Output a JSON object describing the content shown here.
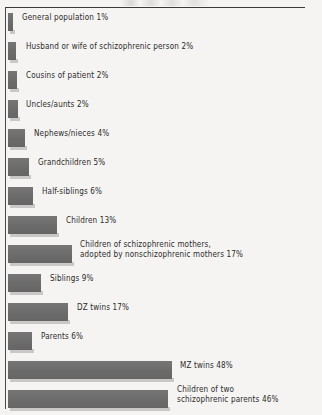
{
  "figure": {
    "background_color": "#f5f4f2",
    "bar_color": "#6e6e6e",
    "bar_shadow_color": "#c9c8c6",
    "rule_color": "#3a3a3a",
    "text_color": "#2b2b2b"
  },
  "chart_data": {
    "type": "bar",
    "orientation": "horizontal",
    "title": "",
    "subtitle": "",
    "xlabel": "",
    "ylabel": "",
    "xlim": [
      0,
      50
    ],
    "grid": false,
    "legend": null,
    "value_unit": "%",
    "categories": [
      "General population",
      "Husband or wife of schizophrenic person",
      "Cousins of patient",
      "Uncles/aunts",
      "Nephews/nieces",
      "Grandchildren",
      "Half-siblings",
      "Children",
      "Children of schizophrenic mothers, adopted by nonschizophrenic mothers",
      "Siblings",
      "DZ twins",
      "Parents",
      "MZ twins",
      "Children of two schizophrenic parents"
    ],
    "values": [
      1,
      2,
      2,
      2,
      4,
      5,
      6,
      13,
      17,
      9,
      17,
      6,
      48,
      46
    ],
    "bars": [
      {
        "label_line1": "General population 1%",
        "label_line2": "",
        "value": 1,
        "value_text": "1%",
        "bar_px": 5,
        "top_px": 4,
        "label_left_px": 22,
        "label_top_px": 3
      },
      {
        "label_line1": "Husband or wife of schizophrenic person 2%",
        "label_line2": "",
        "value": 2,
        "value_text": "2%",
        "bar_px": 8,
        "top_px": 33,
        "label_left_px": 26,
        "label_top_px": 32
      },
      {
        "label_line1": "Cousins of patient 2%",
        "label_line2": "",
        "value": 2,
        "value_text": "2%",
        "bar_px": 9,
        "top_px": 62,
        "label_left_px": 26,
        "label_top_px": 61
      },
      {
        "label_line1": "Uncles/aunts 2%",
        "label_line2": "",
        "value": 2,
        "value_text": "2%",
        "bar_px": 10,
        "top_px": 91,
        "label_left_px": 26,
        "label_top_px": 90
      },
      {
        "label_line1": "Nephews/nieces 4%",
        "label_line2": "",
        "value": 4,
        "value_text": "4%",
        "bar_px": 17,
        "top_px": 120,
        "label_left_px": 34,
        "label_top_px": 119
      },
      {
        "label_line1": "Grandchildren 5%",
        "label_line2": "",
        "value": 5,
        "value_text": "5%",
        "bar_px": 21,
        "top_px": 149,
        "label_left_px": 38,
        "label_top_px": 148
      },
      {
        "label_line1": "Half-siblings 6%",
        "label_line2": "",
        "value": 6,
        "value_text": "6%",
        "bar_px": 25,
        "top_px": 178,
        "label_left_px": 42,
        "label_top_px": 177
      },
      {
        "label_line1": "Children 13%",
        "label_line2": "",
        "value": 13,
        "value_text": "13%",
        "bar_px": 49,
        "top_px": 207,
        "label_left_px": 66,
        "label_top_px": 206
      },
      {
        "label_line1": "Children of schizophrenic mothers,",
        "label_line2": "adopted by nonschizophrenic mothers 17%",
        "value": 17,
        "value_text": "17%",
        "bar_px": 64,
        "top_px": 236,
        "label_left_px": 80,
        "label_top_px": 230
      },
      {
        "label_line1": "Siblings 9%",
        "label_line2": "",
        "value": 9,
        "value_text": "9%",
        "bar_px": 33,
        "top_px": 265,
        "label_left_px": 50,
        "label_top_px": 264
      },
      {
        "label_line1": "DZ twins 17%",
        "label_line2": "",
        "value": 17,
        "value_text": "17%",
        "bar_px": 60,
        "top_px": 294,
        "label_left_px": 77,
        "label_top_px": 293
      },
      {
        "label_line1": "Parents 6%",
        "label_line2": "",
        "value": 6,
        "value_text": "6%",
        "bar_px": 24,
        "top_px": 323,
        "label_left_px": 41,
        "label_top_px": 322
      },
      {
        "label_line1": "MZ twins 48%",
        "label_line2": "",
        "value": 48,
        "value_text": "48%",
        "bar_px": 164,
        "top_px": 352,
        "label_left_px": 180,
        "label_top_px": 351
      },
      {
        "label_line1": "Children of two",
        "label_line2": "schizophrenic parents 46%",
        "value": 46,
        "value_text": "46%",
        "bar_px": 160,
        "top_px": 381,
        "label_left_px": 177,
        "label_top_px": 375
      }
    ]
  }
}
